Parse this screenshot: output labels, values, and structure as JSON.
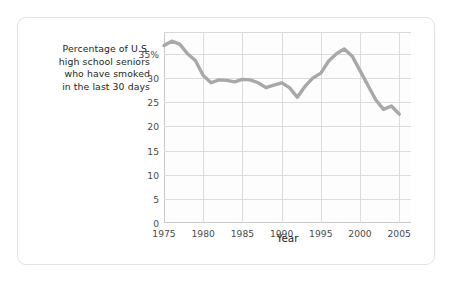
{
  "caption": {
    "lines": [
      "Percentage of U.S.",
      "high school seniors",
      "who have smoked",
      "in the last 30 days"
    ],
    "full_text": "Percentage of U.S. high school seniors who have smoked in the last 30 days"
  },
  "axis": {
    "x_title": "Year"
  },
  "colors": {
    "line": "#a8a8a8",
    "grid": "#dcdcdc",
    "axis": "#c9c9c9",
    "text": "#231f20",
    "tick_text": "#4a4a4a",
    "card_border": "#e3e3e3",
    "plot_bg": "#fdfdfd",
    "page_bg": "#ffffff"
  },
  "chart_data": {
    "type": "line",
    "title": "",
    "subtitle": "",
    "xlabel": "Year",
    "ylabel": "Percentage of U.S. high school seniors who have smoked in the last 30 days",
    "xlim": [
      1975,
      2006.5
    ],
    "ylim": [
      0,
      39.5
    ],
    "grid": true,
    "legend": null,
    "x_ticks": [
      1975,
      1980,
      1985,
      1990,
      1995,
      2000,
      2005
    ],
    "x_tick_labels": [
      "1975",
      "1980",
      "1985",
      "1990",
      "1995",
      "2000",
      "2005"
    ],
    "y_ticks": [
      0,
      5,
      10,
      15,
      20,
      25,
      30,
      35
    ],
    "y_tick_labels": [
      "0",
      "5",
      "10",
      "15",
      "20",
      "25",
      "30",
      "35%"
    ],
    "series": [
      {
        "name": "Percent smoked in last 30 days",
        "color": "#a8a8a8",
        "x": [
          1975,
          1976,
          1977,
          1978,
          1979,
          1980,
          1981,
          1982,
          1983,
          1984,
          1985,
          1986,
          1987,
          1988,
          1989,
          1990,
          1991,
          1992,
          1993,
          1994,
          1995,
          1996,
          1997,
          1998,
          1999,
          2000,
          2001,
          2002,
          2003,
          2004,
          2005
        ],
        "values": [
          36.7,
          37.6,
          37.0,
          35.0,
          33.6,
          30.5,
          29.0,
          29.6,
          29.5,
          29.2,
          29.7,
          29.6,
          29.0,
          28.0,
          28.5,
          29.0,
          28.0,
          26.0,
          28.3,
          30.0,
          31.0,
          33.5,
          35.0,
          36.0,
          34.5,
          31.5,
          28.5,
          25.5,
          23.5,
          24.2,
          22.5
        ]
      }
    ]
  }
}
